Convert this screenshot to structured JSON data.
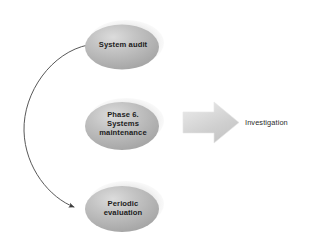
{
  "diagram": {
    "background_color": "#ffffff",
    "nodes": [
      {
        "id": "system-audit",
        "label": "System audit",
        "shape": "ellipse",
        "fill_color": "#b5b5b5"
      },
      {
        "id": "phase-6-systems-maintenance",
        "label": "Phase 6.\nSystems\nmaintenance",
        "shape": "ellipse",
        "fill_color": "#b5b5b5"
      },
      {
        "id": "periodic-evaluation",
        "label": "Periodic\nevaluation",
        "shape": "ellipse",
        "fill_color": "#b5b5b5"
      }
    ],
    "connectors": [
      {
        "id": "curved-arrow",
        "from": "system-audit",
        "to": "periodic-evaluation",
        "style": "curved",
        "color": "#5a5a5a"
      },
      {
        "id": "block-arrow",
        "direction": "right",
        "fill_color": "#d8d8d8"
      }
    ],
    "outcome": {
      "id": "investigation",
      "label": "Investigation",
      "text_color": "#2a2a2a"
    }
  }
}
